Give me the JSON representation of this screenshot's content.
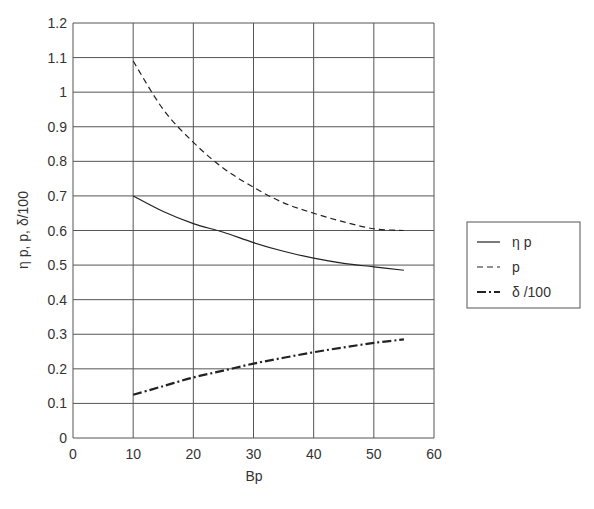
{
  "chart_data": {
    "type": "line",
    "title": "",
    "xlabel": "Bp",
    "ylabel": "η p,  p,  δ/100",
    "xlim": [
      0,
      60
    ],
    "ylim": [
      0,
      1.2
    ],
    "xticks": [
      "0",
      "10",
      "20",
      "30",
      "40",
      "50",
      "60"
    ],
    "yticks": [
      "0",
      "0.1",
      "0.2",
      "0.3",
      "0.4",
      "0.5",
      "0.6",
      "0.7",
      "0.8",
      "0.9",
      "1",
      "1.1",
      "1.2"
    ],
    "grid": true,
    "legend_position": "right",
    "x": [
      10,
      15,
      20,
      25,
      30,
      35,
      40,
      45,
      50,
      55
    ],
    "series": [
      {
        "name": "η p",
        "style": "solid",
        "width": 1.2,
        "values": [
          0.7,
          0.655,
          0.62,
          0.595,
          0.565,
          0.54,
          0.52,
          0.505,
          0.495,
          0.485
        ]
      },
      {
        "name": "p",
        "style": "dashed",
        "width": 1.2,
        "values": [
          1.09,
          0.95,
          0.855,
          0.78,
          0.725,
          0.68,
          0.65,
          0.625,
          0.605,
          0.6
        ]
      },
      {
        "name": "δ /100",
        "style": "dashdot",
        "width": 2.2,
        "values": [
          0.125,
          0.15,
          0.175,
          0.195,
          0.215,
          0.232,
          0.248,
          0.262,
          0.275,
          0.285
        ]
      }
    ]
  },
  "colors": {
    "grid": "#555555",
    "line": "#222222",
    "text": "#333333"
  }
}
